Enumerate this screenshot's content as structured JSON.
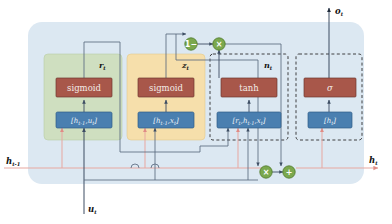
{
  "diagram": {
    "colors": {
      "cell_bg": "#dce8f2",
      "reset_gate_bg": "#cfdfc0",
      "update_gate_bg": "#f6dfab",
      "activation_fill": "#a8574a",
      "concat_fill": "#4a7fb0",
      "operator_fill": "#7ba84e",
      "hidden_line": "#e8a7a0",
      "signal_line": "#5a6a80",
      "dashed_border": "#333333"
    },
    "io_ports": [
      {
        "name": "h-prev-input",
        "label": "h",
        "sub": "t-1",
        "position": "left"
      },
      {
        "name": "u-input",
        "label": "u",
        "sub": "t",
        "position": "bottom"
      },
      {
        "name": "h-output",
        "label": "h",
        "sub": "t",
        "position": "right"
      },
      {
        "name": "o-output",
        "label": "o",
        "sub": "t",
        "position": "top"
      }
    ],
    "blocks": [
      {
        "name": "reset-gate",
        "label": "r",
        "sub": "t",
        "style": "solid-green",
        "activation": "sigmoid",
        "concat": "[h      ,u ]",
        "concat_parts": {
          "open": "[",
          "v1": "h",
          "v1sub": "t-1",
          "comma": ",",
          "v2": "u",
          "v2sub": "t",
          "close": "]"
        }
      },
      {
        "name": "update-gate",
        "label": "z",
        "sub": "t",
        "style": "solid-yellow",
        "activation": "sigmoid",
        "concat_parts": {
          "open": "[",
          "v1": "h",
          "v1sub": "t-1",
          "comma": ",",
          "v2": "x",
          "v2sub": "t",
          "close": "]"
        }
      },
      {
        "name": "candidate-state",
        "label": "n",
        "sub": "t",
        "style": "dashed",
        "activation": "tanh",
        "concat_parts": {
          "open": "[",
          "v1": "r",
          "v1sub": "t",
          "comma": ",",
          "v2": "h",
          "v2sub": "t-1",
          "comma2": ",",
          "v3": "x",
          "v3sub": "t",
          "close": "]"
        }
      },
      {
        "name": "output-projection",
        "label": "",
        "sub": "",
        "style": "dashed",
        "activation": "σ",
        "concat_parts": {
          "open": "[",
          "v1": "h",
          "v1sub": "t",
          "close": "]"
        }
      }
    ],
    "operators": [
      {
        "name": "one-minus-operator",
        "symbol": "1−",
        "x": 191,
        "y": 44
      },
      {
        "name": "multiply-operator-top",
        "symbol": "×",
        "x": 219,
        "y": 44
      },
      {
        "name": "multiply-operator-bottom",
        "symbol": "×",
        "x": 266,
        "y": 172
      },
      {
        "name": "add-operator",
        "symbol": "+",
        "x": 289,
        "y": 172
      }
    ]
  }
}
